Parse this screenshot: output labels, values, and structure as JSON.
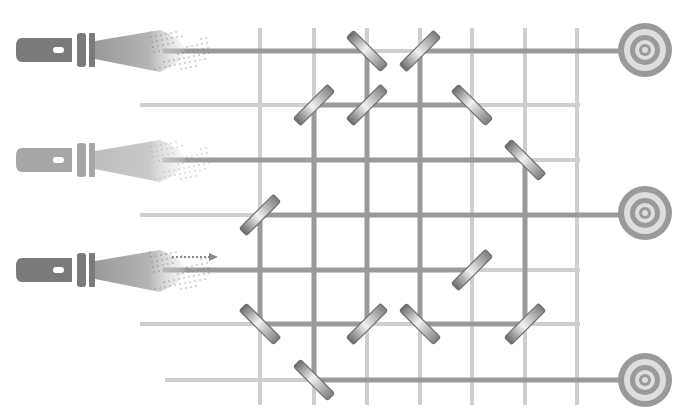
{
  "puzzle": {
    "type": "laser-mirror-puzzle",
    "colors": {
      "background": "#ffffff",
      "grid": "#cfcfcf",
      "beam": "#9a9a9a",
      "flashlight_dark": "#7a7a7a",
      "flashlight_light": "#a6a6a6",
      "target_ring_dark": "#9a9a9a",
      "target_ring_light": "#dedede",
      "mirror_edge": "#6f6f6f"
    },
    "grid": {
      "columns_x": [
        260,
        314,
        367,
        420,
        472,
        525,
        577
      ],
      "rows_y": [
        51,
        105,
        160,
        215,
        270,
        324,
        380
      ],
      "row_extents": [
        {
          "y": 51,
          "x1": 165,
          "x2": 600
        },
        {
          "y": 105,
          "x1": 140,
          "x2": 580
        },
        {
          "y": 160,
          "x1": 165,
          "x2": 580
        },
        {
          "y": 215,
          "x1": 140,
          "x2": 580
        },
        {
          "y": 270,
          "x1": 165,
          "x2": 580
        },
        {
          "y": 324,
          "x1": 140,
          "x2": 580
        },
        {
          "y": 380,
          "x1": 165,
          "x2": 600
        }
      ],
      "col_top": 28,
      "col_bottom": 405
    },
    "flashlights": [
      {
        "id": "flashlight-1",
        "y": 50,
        "shade": "dark",
        "active_indicator": false
      },
      {
        "id": "flashlight-2",
        "y": 160,
        "shade": "light",
        "active_indicator": false
      },
      {
        "id": "flashlight-3",
        "y": 270,
        "shade": "dark",
        "active_indicator": true
      }
    ],
    "targets": [
      {
        "id": "target-1",
        "x": 645,
        "y": 50
      },
      {
        "id": "target-2",
        "x": 645,
        "y": 213
      },
      {
        "id": "target-3",
        "x": 645,
        "y": 380
      }
    ],
    "mirrors": [
      {
        "x": 367,
        "y": 51,
        "orientation": "backslash"
      },
      {
        "x": 420,
        "y": 51,
        "orientation": "slash"
      },
      {
        "x": 314,
        "y": 105,
        "orientation": "slash"
      },
      {
        "x": 367,
        "y": 105,
        "orientation": "slash"
      },
      {
        "x": 472,
        "y": 105,
        "orientation": "backslash"
      },
      {
        "x": 525,
        "y": 160,
        "orientation": "backslash"
      },
      {
        "x": 260,
        "y": 215,
        "orientation": "slash"
      },
      {
        "x": 472,
        "y": 270,
        "orientation": "slash"
      },
      {
        "x": 260,
        "y": 324,
        "orientation": "backslash"
      },
      {
        "x": 367,
        "y": 324,
        "orientation": "slash"
      },
      {
        "x": 420,
        "y": 324,
        "orientation": "backslash"
      },
      {
        "x": 525,
        "y": 324,
        "orientation": "slash"
      },
      {
        "x": 314,
        "y": 380,
        "orientation": "backslash"
      }
    ],
    "beams": [
      {
        "x1": 165,
        "y1": 51,
        "x2": 367,
        "y2": 51
      },
      {
        "x1": 367,
        "y1": 51,
        "x2": 367,
        "y2": 105
      },
      {
        "x1": 420,
        "y1": 51,
        "x2": 622,
        "y2": 51
      },
      {
        "x1": 420,
        "y1": 51,
        "x2": 420,
        "y2": 324
      },
      {
        "x1": 314,
        "y1": 105,
        "x2": 472,
        "y2": 105
      },
      {
        "x1": 314,
        "y1": 105,
        "x2": 314,
        "y2": 380
      },
      {
        "x1": 367,
        "y1": 105,
        "x2": 367,
        "y2": 324
      },
      {
        "x1": 165,
        "y1": 160,
        "x2": 525,
        "y2": 160
      },
      {
        "x1": 525,
        "y1": 160,
        "x2": 525,
        "y2": 324
      },
      {
        "x1": 260,
        "y1": 215,
        "x2": 622,
        "y2": 215
      },
      {
        "x1": 260,
        "y1": 215,
        "x2": 260,
        "y2": 324
      },
      {
        "x1": 165,
        "y1": 270,
        "x2": 472,
        "y2": 270
      },
      {
        "x1": 260,
        "y1": 324,
        "x2": 367,
        "y2": 324
      },
      {
        "x1": 420,
        "y1": 324,
        "x2": 525,
        "y2": 324
      },
      {
        "x1": 314,
        "y1": 380,
        "x2": 622,
        "y2": 380
      }
    ]
  }
}
